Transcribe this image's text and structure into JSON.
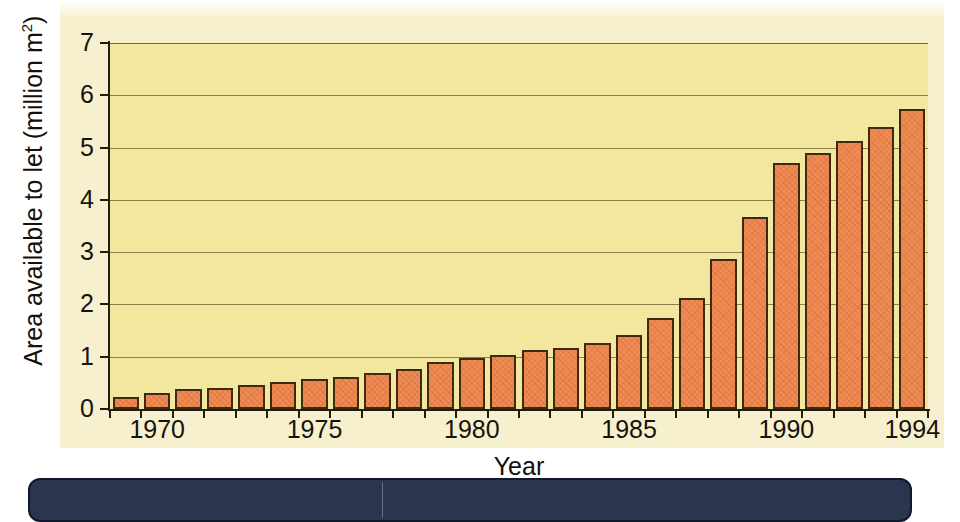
{
  "chart_data": {
    "type": "bar",
    "title": "",
    "xlabel": "Year",
    "ylabel": "Area available to let (million m²)",
    "ylabel_text": "Area available to let (million m",
    "ylabel_sup": "2",
    "ylabel_tail": ")",
    "ylim": [
      0,
      7
    ],
    "ytick_labels": [
      "0",
      "1",
      "2",
      "3",
      "4",
      "5",
      "6",
      "7"
    ],
    "ytick_values": [
      0,
      1,
      2,
      3,
      4,
      5,
      6,
      7
    ],
    "xtick_labels": [
      "1970",
      "1975",
      "1980",
      "1985",
      "1990",
      "1994"
    ],
    "xtick_values": [
      1970,
      1975,
      1980,
      1985,
      1990,
      1994
    ],
    "xlim": [
      1968.5,
      1994.5
    ],
    "grid": "horizontal",
    "legend": "none",
    "bar_color": "#ee8c54",
    "bar_edge_color": "#3d2a12",
    "plot_background": "#f3e79f",
    "panel_background": "#f7f0cf",
    "categories": [
      1969,
      1970,
      1971,
      1972,
      1973,
      1974,
      1975,
      1976,
      1977,
      1978,
      1979,
      1980,
      1981,
      1982,
      1983,
      1984,
      1985,
      1986,
      1987,
      1988,
      1989,
      1990,
      1991,
      1992,
      1993,
      1994
    ],
    "values": [
      0.23,
      0.3,
      0.38,
      0.41,
      0.45,
      0.51,
      0.58,
      0.62,
      0.69,
      0.76,
      0.9,
      0.97,
      1.03,
      1.12,
      1.17,
      1.27,
      1.41,
      1.75,
      2.13,
      2.87,
      3.68,
      4.7,
      4.9,
      5.12,
      5.4,
      5.73
    ]
  },
  "footer": {
    "strip_color": "#2c3550"
  }
}
